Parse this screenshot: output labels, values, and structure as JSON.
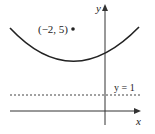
{
  "diagram": {
    "type": "parabola-focus-directrix",
    "axes": {
      "x_label": "x",
      "y_label": "y"
    },
    "point": {
      "label": "(−2, 5)",
      "x": -2,
      "y": 5
    },
    "directrix": {
      "label": "y = 1",
      "equation_y": 1,
      "style": "dashed"
    },
    "curve": {
      "kind": "parabola",
      "opens": "up"
    },
    "colors": {
      "ink": "#222222",
      "axis": "#333333",
      "dashed": "#444444"
    }
  }
}
